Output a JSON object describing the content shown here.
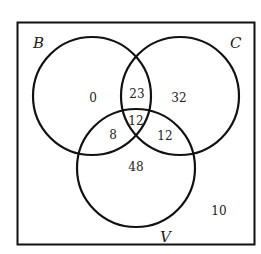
{
  "diagram": {
    "type": "venn",
    "colors": {
      "stroke": "#111111",
      "text": "#222222",
      "background": "#ffffff"
    },
    "sets": [
      {
        "name": "B",
        "label": "B"
      },
      {
        "name": "C",
        "label": "C"
      },
      {
        "name": "V",
        "label": "V"
      }
    ],
    "regions": {
      "B_only": "0",
      "C_only": "32",
      "V_only": "48",
      "B_and_C_only": "23",
      "B_and_V_only": "8",
      "C_and_V_only": "12",
      "B_and_C_and_V": "12",
      "outside": "10"
    }
  }
}
